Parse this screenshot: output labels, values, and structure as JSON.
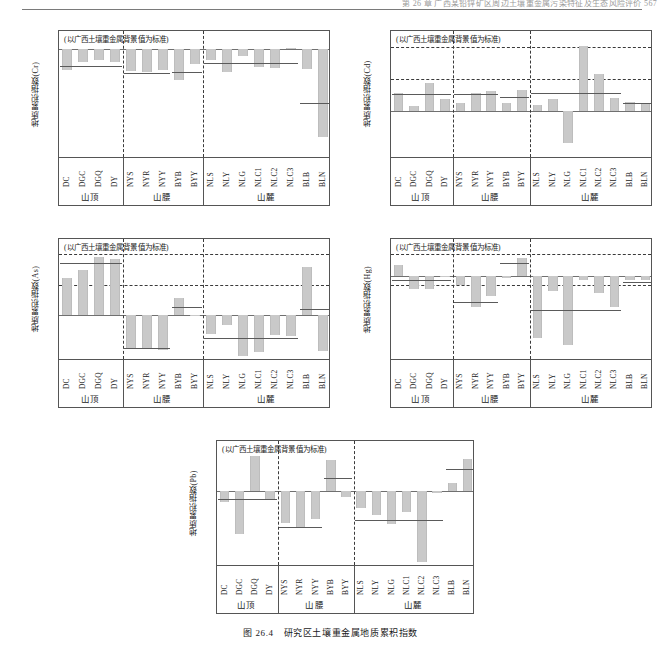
{
  "page": {
    "header_text": "第 26 章  广西某铅锌矿区周边土壤重金属污染特征及生态风险评价   567",
    "caption_number": "图 26.4",
    "caption_text": "研究区土壤重金属地质累积指数"
  },
  "common": {
    "note": "(以广西土壤重金属背景值为标准)",
    "ylabel_prefix": "地质累积指数",
    "groups": [
      {
        "label": "山顶",
        "sites": [
          "DC",
          "DGC",
          "DGQ",
          "DY"
        ]
      },
      {
        "label": "山腰",
        "sites": [
          "NYS",
          "NYR",
          "NYY",
          "BYB",
          "BYY"
        ]
      },
      {
        "label": "山麓",
        "sites": [
          "NLS",
          "NLY",
          "NLG",
          "NLC1",
          "NLC2",
          "NLC3",
          "BLB",
          "BLN"
        ]
      }
    ],
    "bar_color": "#c9c9c9",
    "mean_line_color": "#5a5a5a",
    "axis_color": "#555555",
    "grid_color": "#3a3a3a"
  },
  "chart_data": [
    {
      "id": "cr",
      "type": "bar",
      "element": "Cr",
      "title": "",
      "note": "(以广西土壤重金属背景值为标准)",
      "ylabel": "地质累积指数(Cr)",
      "xlabel": "",
      "ylim": [
        -3.0,
        0.5
      ],
      "yticks": [
        0.5,
        0.0,
        -0.5,
        -1.0,
        -1.5,
        -2.0,
        -2.5,
        -3.0
      ],
      "ytick_labels": [
        "0.5",
        "0.0",
        "-0.5",
        "-1.0",
        "-1.5",
        "-2.0",
        "-2.5",
        "-3.0"
      ],
      "dashed_gridlines": [],
      "grid": false,
      "legend": "none",
      "categories": [
        "DC",
        "DGC",
        "DGQ",
        "DY",
        "NYS",
        "NYR",
        "NYY",
        "BYB",
        "BYY",
        "NLS",
        "NLY",
        "NLG",
        "NLC1",
        "NLC2",
        "NLC3",
        "BLB",
        "BLN"
      ],
      "values": [
        -0.57,
        -0.36,
        -0.28,
        -0.36,
        -0.6,
        -0.62,
        -0.56,
        -0.84,
        -0.39,
        -0.29,
        -0.61,
        -0.18,
        -0.48,
        -0.52,
        0.03,
        -0.55,
        -2.41
      ],
      "group_means": [
        {
          "group": "山顶",
          "value": -0.45
        },
        {
          "group": "山腰",
          "value": -0.64
        },
        {
          "group": "山腰_BY",
          "value": -0.63
        },
        {
          "group": "山麓",
          "value": -0.37
        },
        {
          "group": "山麓_BL",
          "value": -1.48
        }
      ]
    },
    {
      "id": "cd",
      "type": "bar",
      "element": "Cd",
      "title": "",
      "note": "(以广西土壤重金属背景值为标准)",
      "ylabel": "地质累积指数(Cd)",
      "xlabel": "",
      "ylim": [
        -1.5,
        2.5
      ],
      "yticks": [
        2.5,
        2.0,
        1.5,
        1.0,
        0.5,
        0.0,
        -0.5,
        -1.0,
        -1.5
      ],
      "ytick_labels": [
        "2.5",
        "2.0",
        "1.5",
        "1.0",
        "0.5",
        "0.0",
        "-0.5",
        "-1.0",
        "-1.5"
      ],
      "dashed_gridlines": [
        2.0,
        1.0
      ],
      "grid": true,
      "legend": "none",
      "categories": [
        "DC",
        "DGC",
        "DGQ",
        "DY",
        "NYS",
        "NYR",
        "NYY",
        "BYB",
        "BYY",
        "NLS",
        "NLY",
        "NLG",
        "NLC1",
        "NLC2",
        "NLC3",
        "BLB",
        "BLN"
      ],
      "values": [
        0.56,
        0.15,
        0.89,
        0.39,
        0.26,
        0.56,
        0.61,
        0.25,
        0.65,
        0.18,
        0.39,
        -1.0,
        2.02,
        1.15,
        0.42,
        0.29,
        0.23
      ],
      "group_means": [
        {
          "group": "山顶",
          "value": 0.52
        },
        {
          "group": "山腰",
          "value": 0.52
        },
        {
          "group": "山腰_BY",
          "value": 0.45
        },
        {
          "group": "山麓",
          "value": 0.55
        },
        {
          "group": "山麓_BL",
          "value": 0.26
        }
      ]
    },
    {
      "id": "as",
      "type": "bar",
      "element": "As",
      "title": "",
      "note": "(以广西土壤重金属背景值为标准)",
      "ylabel": "地质累积指数(As)",
      "xlabel": "",
      "ylim": [
        -1.5,
        2.5
      ],
      "yticks": [
        2.5,
        2.0,
        1.5,
        1.0,
        0.5,
        0.0,
        -0.5,
        -1.0,
        -1.5
      ],
      "ytick_labels": [
        "2.5",
        "2.0",
        "1.5",
        "1.0",
        "0.5",
        "0.0",
        "-0.5",
        "-1.0",
        "-1.5"
      ],
      "dashed_gridlines": [
        2.0,
        1.0
      ],
      "grid": true,
      "legend": "none",
      "categories": [
        "DC",
        "DGC",
        "DGQ",
        "DY",
        "NYS",
        "NYR",
        "NYY",
        "BYB",
        "BYY",
        "NLS",
        "NLY",
        "NLG",
        "NLC1",
        "NLC2",
        "NLC3",
        "BLB",
        "BLN"
      ],
      "values": [
        1.21,
        1.49,
        1.9,
        1.84,
        -1.09,
        -1.09,
        -1.13,
        0.55,
        -0.04,
        -0.62,
        -0.31,
        -1.35,
        -1.21,
        -0.66,
        -0.67,
        1.57,
        -1.18
      ],
      "group_means": [
        {
          "group": "山顶",
          "value": 1.7
        },
        {
          "group": "山腰",
          "value": -1.08
        },
        {
          "group": "山腰_BY",
          "value": 0.27
        },
        {
          "group": "山麓",
          "value": -0.74
        },
        {
          "group": "山麓_BL",
          "value": 0.21
        }
      ]
    },
    {
      "id": "hg",
      "type": "bar",
      "element": "Hg",
      "title": "",
      "note": "(以广西土壤重金属背景值为标准)",
      "ylabel": "地质累积指数(Hg)",
      "xlabel": "",
      "ylim": [
        -1.4,
        0.6
      ],
      "yticks": [
        0.6,
        0.4,
        0.2,
        0.0,
        -0.2,
        -0.4,
        -0.6,
        -0.8,
        -1.0,
        -1.2,
        -1.4
      ],
      "ytick_labels": [
        "0.6",
        "0.4",
        "0.2",
        "0.0",
        "-0.2",
        "-0.4",
        "-0.6",
        "-0.8",
        "-1.0",
        "-1.2",
        "-1.4"
      ],
      "dashed_gridlines": [
        0.35,
        -0.16
      ],
      "grid": true,
      "legend": "none",
      "categories": [
        "DC",
        "DGC",
        "DGQ",
        "DY",
        "NYS",
        "NYR",
        "NYY",
        "BYB",
        "BYY",
        "NLS",
        "NLY",
        "NLG",
        "NLC1",
        "NLC2",
        "NLC3",
        "BLB",
        "BLN"
      ],
      "values": [
        0.17,
        -0.22,
        -0.22,
        -0.01,
        -0.15,
        -0.51,
        -0.34,
        -0.04,
        0.29,
        -1.03,
        -0.26,
        -1.13,
        -0.08,
        -0.29,
        -0.52,
        -0.07,
        -0.08
      ],
      "group_means": [
        {
          "group": "山顶",
          "value": -0.07
        },
        {
          "group": "山腰",
          "value": -0.44
        },
        {
          "group": "山腰_BY",
          "value": 0.21
        },
        {
          "group": "山麓",
          "value": -0.56
        },
        {
          "group": "山麓_BL",
          "value": -0.11
        }
      ]
    },
    {
      "id": "pb",
      "type": "bar",
      "element": "Pb",
      "title": "",
      "note": "(以广西土壤重金属背景值为标准)",
      "ylabel": "地质累积指数(Pb)",
      "xlabel": "",
      "ylim": [
        -1.2,
        0.8
      ],
      "yticks": [
        0.8,
        0.4,
        0.0,
        -0.4,
        -0.8,
        -1.2
      ],
      "ytick_labels": [
        "0.8",
        "0.4",
        "0.0",
        "-0.4",
        "-0.8",
        "-1.2"
      ],
      "dashed_gridlines": [],
      "grid": false,
      "legend": "none",
      "categories": [
        "DC",
        "DGC",
        "DGQ",
        "DY",
        "NYS",
        "NYR",
        "NYY",
        "BYB",
        "BYY",
        "NLS",
        "NLY",
        "NLG",
        "NLC1",
        "NLC2",
        "NLC3",
        "BLB",
        "BLN"
      ],
      "values": [
        -0.17,
        -0.67,
        0.56,
        -0.14,
        -0.5,
        -0.57,
        -0.44,
        0.5,
        -0.09,
        -0.27,
        -0.38,
        -0.52,
        -0.33,
        -1.12,
        -0.02,
        0.14,
        0.51
      ],
      "group_means": [
        {
          "group": "山顶",
          "value": -0.12
        },
        {
          "group": "山腰",
          "value": -0.56
        },
        {
          "group": "山腰_BY",
          "value": 0.21
        },
        {
          "group": "山麓",
          "value": -0.45
        },
        {
          "group": "山麓_BL",
          "value": 0.35
        }
      ]
    }
  ]
}
